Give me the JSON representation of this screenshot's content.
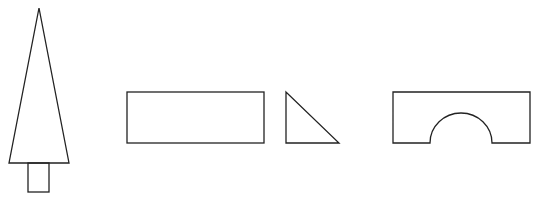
{
  "canvas": {
    "width": 542,
    "height": 200,
    "background": "#ffffff",
    "stroke": "#222222"
  },
  "shapes": [
    {
      "name": "tree",
      "parts": [
        "triangle",
        "trunk-rectangle"
      ]
    },
    {
      "name": "rectangle-block"
    },
    {
      "name": "right-triangle-block"
    },
    {
      "name": "arch-block"
    }
  ]
}
